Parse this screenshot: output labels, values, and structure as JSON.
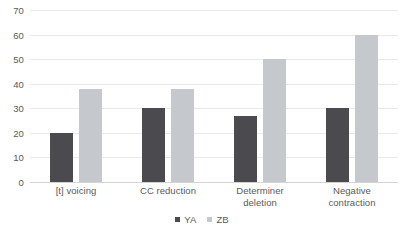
{
  "chart_data": {
    "type": "bar",
    "title": "",
    "subtitle": "",
    "xlabel": "",
    "ylabel": "",
    "ylim": [
      0,
      70
    ],
    "ytick_step": 10,
    "yticks": [
      "0",
      "10",
      "20",
      "30",
      "40",
      "50",
      "60",
      "70"
    ],
    "grid": "horizontal",
    "legend_position": "bottom-center",
    "categories": [
      "[t] voicing",
      "CC reduction",
      "Determiner deletion",
      "Negative contraction"
    ],
    "category_lines": [
      [
        "[t] voicing"
      ],
      [
        "CC reduction"
      ],
      [
        "Determiner",
        "deletion"
      ],
      [
        "Negative",
        "contraction"
      ]
    ],
    "series": [
      {
        "name": "YA",
        "color": "#4a4a4f",
        "values": [
          20,
          30,
          27,
          30
        ]
      },
      {
        "name": "ZB",
        "color": "#c5c8cc",
        "values": [
          38,
          38,
          50,
          60
        ]
      }
    ]
  },
  "legend": {
    "items": [
      {
        "label": "YA",
        "color": "#4a4a4f"
      },
      {
        "label": "ZB",
        "color": "#c5c8cc"
      }
    ]
  },
  "colors": {
    "series_ya": "#4a4a4f",
    "series_zb": "#c5c8cc",
    "gridline": "#e8e8ea",
    "axis": "#d4d4d6",
    "text": "#59595c",
    "background": "#ffffff"
  }
}
